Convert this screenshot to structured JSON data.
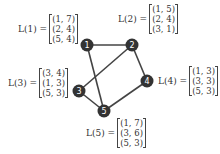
{
  "graph": {
    "node_color": "#333333",
    "edge_color": "#444444",
    "nodes": [
      {
        "id": "1",
        "x": 87,
        "y": 45
      },
      {
        "id": "2",
        "x": 132,
        "y": 45
      },
      {
        "id": "3",
        "x": 79,
        "y": 91
      },
      {
        "id": "4",
        "x": 147,
        "y": 81
      },
      {
        "id": "5",
        "x": 104,
        "y": 111
      }
    ],
    "edges": [
      [
        "1",
        "2"
      ],
      [
        "1",
        "5"
      ],
      [
        "2",
        "3"
      ],
      [
        "2",
        "4"
      ],
      [
        "3",
        "5"
      ],
      [
        "4",
        "5"
      ]
    ]
  },
  "labels": {
    "L1": {
      "name": "L(1) =",
      "rows": [
        "(1, 7)",
        "(2, 4)",
        "(5, 4)"
      ]
    },
    "L2": {
      "name": "L(2) =",
      "rows": [
        "(1, 5)",
        "(2, 4)",
        "(3, 1)"
      ]
    },
    "L3": {
      "name": "L(3) =",
      "rows": [
        "(3, 4)",
        "(1, 3)",
        "(5, 3)"
      ]
    },
    "L4": {
      "name": "L(4) =",
      "rows": [
        "(1, 3)",
        "(3, 3)",
        "(5, 3)"
      ]
    },
    "L5": {
      "name": "L(5) =",
      "rows": [
        "(1, 7)",
        "(3, 6)",
        "(5, 3)"
      ]
    }
  }
}
